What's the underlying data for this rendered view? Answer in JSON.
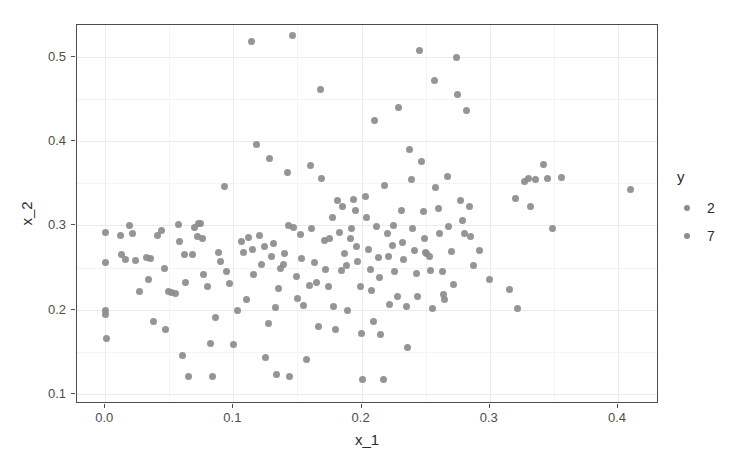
{
  "chart_data": {
    "type": "scatter",
    "title": "",
    "xlabel": "x_1",
    "ylabel": "x_2",
    "xlim": [
      -0.022,
      0.432
    ],
    "ylim": [
      0.088,
      0.538
    ],
    "xticks": [
      0.0,
      0.1,
      0.2,
      0.3,
      0.4
    ],
    "xtick_labels": [
      "0.0",
      "0.1",
      "0.2",
      "0.3",
      "0.4"
    ],
    "yticks": [
      0.1,
      0.2,
      0.3,
      0.4,
      0.5
    ],
    "ytick_labels": [
      "0.1",
      "0.2",
      "0.3",
      "0.4",
      "0.5"
    ],
    "grid": true,
    "grid_minor": true,
    "point_color": "#8c8c8c",
    "point_size_px": 7,
    "legend": {
      "title": "y",
      "position": "right",
      "entries": [
        {
          "label": "2",
          "color": "#8c8c8c"
        },
        {
          "label": "7",
          "color": "#8c8c8c"
        }
      ]
    },
    "series": [
      {
        "name": "points",
        "color": "#8c8c8c",
        "points": [
          [
            0.0,
            0.292
          ],
          [
            0.0,
            0.256
          ],
          [
            0.0,
            0.199
          ],
          [
            0.0,
            0.194
          ],
          [
            0.001,
            0.166
          ],
          [
            0.012,
            0.288
          ],
          [
            0.013,
            0.266
          ],
          [
            0.016,
            0.259
          ],
          [
            0.019,
            0.3
          ],
          [
            0.021,
            0.291
          ],
          [
            0.024,
            0.258
          ],
          [
            0.027,
            0.221
          ],
          [
            0.032,
            0.262
          ],
          [
            0.034,
            0.236
          ],
          [
            0.035,
            0.261
          ],
          [
            0.038,
            0.186
          ],
          [
            0.041,
            0.288
          ],
          [
            0.044,
            0.294
          ],
          [
            0.046,
            0.249
          ],
          [
            0.047,
            0.176
          ],
          [
            0.049,
            0.221
          ],
          [
            0.052,
            0.22
          ],
          [
            0.055,
            0.219
          ],
          [
            0.057,
            0.301
          ],
          [
            0.058,
            0.281
          ],
          [
            0.06,
            0.146
          ],
          [
            0.062,
            0.265
          ],
          [
            0.063,
            0.232
          ],
          [
            0.065,
            0.121
          ],
          [
            0.068,
            0.266
          ],
          [
            0.07,
            0.298
          ],
          [
            0.072,
            0.287
          ],
          [
            0.073,
            0.302
          ],
          [
            0.074,
            0.302
          ],
          [
            0.076,
            0.285
          ],
          [
            0.077,
            0.242
          ],
          [
            0.08,
            0.228
          ],
          [
            0.082,
            0.16
          ],
          [
            0.084,
            0.121
          ],
          [
            0.086,
            0.191
          ],
          [
            0.088,
            0.268
          ],
          [
            0.09,
            0.257
          ],
          [
            0.093,
            0.346
          ],
          [
            0.095,
            0.245
          ],
          [
            0.097,
            0.231
          ],
          [
            0.1,
            0.159
          ],
          [
            0.103,
            0.199
          ],
          [
            0.106,
            0.281
          ],
          [
            0.108,
            0.268
          ],
          [
            0.11,
            0.212
          ],
          [
            0.112,
            0.286
          ],
          [
            0.114,
            0.519
          ],
          [
            0.115,
            0.272
          ],
          [
            0.116,
            0.242
          ],
          [
            0.118,
            0.396
          ],
          [
            0.12,
            0.288
          ],
          [
            0.122,
            0.254
          ],
          [
            0.124,
            0.275
          ],
          [
            0.125,
            0.143
          ],
          [
            0.127,
            0.183
          ],
          [
            0.128,
            0.38
          ],
          [
            0.13,
            0.263
          ],
          [
            0.131,
            0.279
          ],
          [
            0.133,
            0.202
          ],
          [
            0.134,
            0.123
          ],
          [
            0.135,
            0.225
          ],
          [
            0.137,
            0.249
          ],
          [
            0.139,
            0.254
          ],
          [
            0.14,
            0.267
          ],
          [
            0.142,
            0.363
          ],
          [
            0.143,
            0.3
          ],
          [
            0.144,
            0.121
          ],
          [
            0.146,
            0.525
          ],
          [
            0.147,
            0.297
          ],
          [
            0.149,
            0.239
          ],
          [
            0.15,
            0.213
          ],
          [
            0.152,
            0.289
          ],
          [
            0.153,
            0.261
          ],
          [
            0.155,
            0.205
          ],
          [
            0.157,
            0.141
          ],
          [
            0.159,
            0.229
          ],
          [
            0.16,
            0.371
          ],
          [
            0.161,
            0.296
          ],
          [
            0.163,
            0.256
          ],
          [
            0.165,
            0.232
          ],
          [
            0.166,
            0.18
          ],
          [
            0.168,
            0.461
          ],
          [
            0.169,
            0.356
          ],
          [
            0.171,
            0.282
          ],
          [
            0.172,
            0.248
          ],
          [
            0.174,
            0.228
          ],
          [
            0.175,
            0.285
          ],
          [
            0.177,
            0.31
          ],
          [
            0.178,
            0.204
          ],
          [
            0.18,
            0.177
          ],
          [
            0.181,
            0.33
          ],
          [
            0.183,
            0.292
          ],
          [
            0.184,
            0.246
          ],
          [
            0.185,
            0.322
          ],
          [
            0.187,
            0.267
          ],
          [
            0.188,
            0.253
          ],
          [
            0.189,
            0.199
          ],
          [
            0.191,
            0.284
          ],
          [
            0.192,
            0.296
          ],
          [
            0.194,
            0.331
          ],
          [
            0.195,
            0.318
          ],
          [
            0.196,
            0.275
          ],
          [
            0.197,
            0.257
          ],
          [
            0.199,
            0.228
          ],
          [
            0.2,
            0.172
          ],
          [
            0.201,
            0.117
          ],
          [
            0.203,
            0.334
          ],
          [
            0.204,
            0.31
          ],
          [
            0.205,
            0.272
          ],
          [
            0.207,
            0.248
          ],
          [
            0.208,
            0.223
          ],
          [
            0.209,
            0.186
          ],
          [
            0.21,
            0.425
          ],
          [
            0.212,
            0.299
          ],
          [
            0.213,
            0.262
          ],
          [
            0.214,
            0.238
          ],
          [
            0.215,
            0.17
          ],
          [
            0.217,
            0.117
          ],
          [
            0.218,
            0.348
          ],
          [
            0.22,
            0.29
          ],
          [
            0.221,
            0.263
          ],
          [
            0.222,
            0.206
          ],
          [
            0.224,
            0.276
          ],
          [
            0.225,
            0.3
          ],
          [
            0.226,
            0.245
          ],
          [
            0.228,
            0.216
          ],
          [
            0.229,
            0.44
          ],
          [
            0.231,
            0.318
          ],
          [
            0.232,
            0.28
          ],
          [
            0.233,
            0.26
          ],
          [
            0.235,
            0.204
          ],
          [
            0.236,
            0.155
          ],
          [
            0.237,
            0.39
          ],
          [
            0.239,
            0.355
          ],
          [
            0.24,
            0.296
          ],
          [
            0.241,
            0.27
          ],
          [
            0.243,
            0.243
          ],
          [
            0.244,
            0.216
          ],
          [
            0.245,
            0.508
          ],
          [
            0.247,
            0.376
          ],
          [
            0.248,
            0.316
          ],
          [
            0.249,
            0.285
          ],
          [
            0.25,
            0.268
          ],
          [
            0.251,
            0.267
          ],
          [
            0.253,
            0.263
          ],
          [
            0.254,
            0.247
          ],
          [
            0.255,
            0.201
          ],
          [
            0.257,
            0.472
          ],
          [
            0.258,
            0.345
          ],
          [
            0.26,
            0.32
          ],
          [
            0.261,
            0.29
          ],
          [
            0.263,
            0.245
          ],
          [
            0.264,
            0.218
          ],
          [
            0.265,
            0.212
          ],
          [
            0.267,
            0.358
          ],
          [
            0.268,
            0.299
          ],
          [
            0.27,
            0.269
          ],
          [
            0.272,
            0.23
          ],
          [
            0.274,
            0.5
          ],
          [
            0.275,
            0.455
          ],
          [
            0.277,
            0.33
          ],
          [
            0.279,
            0.306
          ],
          [
            0.28,
            0.29
          ],
          [
            0.282,
            0.437
          ],
          [
            0.284,
            0.322
          ],
          [
            0.285,
            0.287
          ],
          [
            0.287,
            0.252
          ],
          [
            0.292,
            0.27
          ],
          [
            0.3,
            0.236
          ],
          [
            0.315,
            0.224
          ],
          [
            0.32,
            0.332
          ],
          [
            0.322,
            0.201
          ],
          [
            0.327,
            0.352
          ],
          [
            0.33,
            0.356
          ],
          [
            0.332,
            0.322
          ],
          [
            0.336,
            0.355
          ],
          [
            0.342,
            0.372
          ],
          [
            0.345,
            0.356
          ],
          [
            0.349,
            0.296
          ],
          [
            0.356,
            0.357
          ],
          [
            0.41,
            0.343
          ]
        ]
      }
    ]
  }
}
